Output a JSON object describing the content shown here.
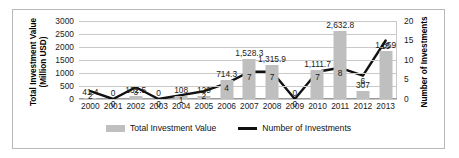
{
  "chart_data": {
    "type": "bar",
    "title": "",
    "categories": [
      "2000",
      "2001",
      "2002",
      "2003",
      "2004",
      "2005",
      "2006",
      "2007",
      "2008",
      "2009",
      "2010",
      "2011",
      "2012",
      "2013"
    ],
    "series": [
      {
        "name": "Total Investment Value",
        "type": "bar",
        "axis": "left",
        "values": [
          41.4,
          0,
          132.5,
          0,
          108,
          129,
          714.3,
          1528.3,
          1315.9,
          0,
          1111.7,
          2632.8,
          307,
          1859
        ],
        "labels": [
          "41.4",
          "0",
          "132.5",
          "0",
          "108",
          "129",
          "714.3",
          "1,528.3",
          "1,315.9",
          "0",
          "1,111.7",
          "2,632.8",
          "307",
          "1,859"
        ],
        "color": "#bfbfbf"
      },
      {
        "name": "Number of Investments",
        "type": "line",
        "axis": "right",
        "values": [
          2,
          0,
          3,
          0,
          1,
          2,
          4,
          7,
          7,
          0,
          7,
          8,
          6,
          15
        ],
        "labels": [
          "2",
          "0",
          "3",
          "0",
          "1",
          "2",
          "4",
          "7",
          "7",
          "0",
          "7",
          "8",
          "6",
          "15"
        ],
        "color": "#111111"
      }
    ],
    "xlabel": "",
    "ylabel": "Total Investment Value (Million USD)",
    "y2label": "Number of Investments",
    "ylim": [
      0,
      3000
    ],
    "y2lim": [
      0,
      20
    ],
    "yticks": [
      "0",
      "500",
      "1000",
      "1500",
      "2000",
      "2500",
      "3000"
    ],
    "y2ticks": [
      "0",
      "5",
      "10",
      "15",
      "20"
    ],
    "grid": true,
    "legend_position": "bottom"
  },
  "axes": {
    "left_title_line1": "Total Investment Value",
    "left_title_line2": "(Million USD)",
    "right_title": "Number of Investments"
  },
  "legend": {
    "items": [
      {
        "label": "Total Investment Value",
        "marker": "bar-swatch"
      },
      {
        "label": "Number of Investments",
        "marker": "line-swatch"
      }
    ]
  }
}
